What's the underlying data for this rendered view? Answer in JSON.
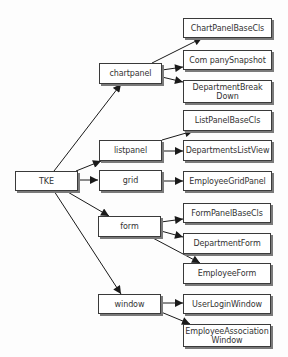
{
  "diagram": {
    "type": "tree",
    "root": "TKE",
    "nodes": {
      "tke": {
        "label": "TKE"
      },
      "chartpanel": {
        "label": "chartpanel"
      },
      "listpanel": {
        "label": "listpanel"
      },
      "grid": {
        "label": "grid"
      },
      "form": {
        "label": "form"
      },
      "window": {
        "label": "window"
      },
      "chart_panel_base_cls": {
        "label": "ChartPanelBaseCls"
      },
      "company_snapshot": {
        "label": "Com panySnapshot"
      },
      "department_breakdown": {
        "label": "DepartmentBreak\nDown"
      },
      "list_panel_base_cls": {
        "label": "ListPanelBaseCls"
      },
      "departments_list_view": {
        "label": "DepartmentsListView"
      },
      "employee_grid_panel": {
        "label": "EmployeeGridPanel"
      },
      "form_panel_base_cls": {
        "label": "FormPanelBaseCls"
      },
      "department_form": {
        "label": "DepartmentForm"
      },
      "employee_form": {
        "label": "EmployeeForm"
      },
      "user_login_window": {
        "label": "UserLoginWindow"
      },
      "employee_association_window": {
        "label": "EmployeeAssociation\nWindow"
      }
    },
    "edges": [
      [
        "TKE",
        "chartpanel"
      ],
      [
        "TKE",
        "listpanel"
      ],
      [
        "TKE",
        "grid"
      ],
      [
        "TKE",
        "form"
      ],
      [
        "TKE",
        "window"
      ],
      [
        "chartpanel",
        "ChartPanelBaseCls"
      ],
      [
        "chartpanel",
        "CompanySnapshot"
      ],
      [
        "chartpanel",
        "DepartmentBreakDown"
      ],
      [
        "listpanel",
        "ListPanelBaseCls"
      ],
      [
        "listpanel",
        "DepartmentsListView"
      ],
      [
        "grid",
        "EmployeeGridPanel"
      ],
      [
        "form",
        "FormPanelBaseCls"
      ],
      [
        "form",
        "DepartmentForm"
      ],
      [
        "form",
        "EmployeeForm"
      ],
      [
        "window",
        "UserLoginWindow"
      ],
      [
        "window",
        "EmployeeAssociationWindow"
      ]
    ],
    "colors": {
      "line": "#1a1a1a",
      "border": "#3a3a3a",
      "shadow": "#7a7a7a",
      "text": "#333333",
      "background": "#fdfdfd"
    }
  }
}
